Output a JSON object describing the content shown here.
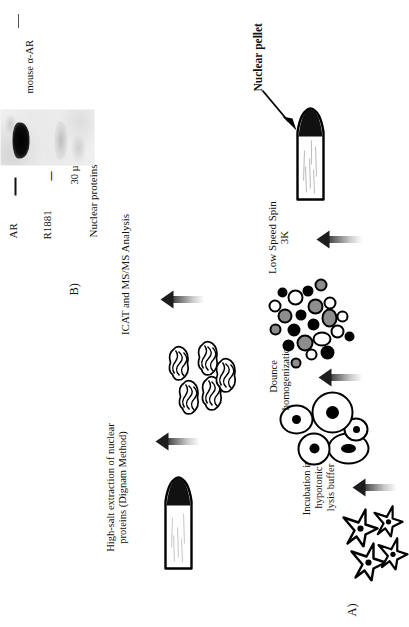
{
  "figure": {
    "panels": [
      {
        "tag": "A)"
      },
      {
        "tag": "B)"
      }
    ]
  },
  "panel_a": {
    "tag": "A)",
    "steps": [
      {
        "name": "cells",
        "caption": ""
      },
      {
        "name": "lysis",
        "caption": "Incubation in hypotonic\nlysis buffer"
      },
      {
        "name": "nuclei",
        "caption": ""
      },
      {
        "name": "homogenize",
        "caption": "Dounce\nhomogenization"
      },
      {
        "name": "homogenate",
        "caption": ""
      },
      {
        "name": "spin",
        "caption": "Low Speed Spin\n3K"
      },
      {
        "name": "pellet-tube",
        "caption": ""
      }
    ],
    "pellet_label": "Nuclear pellet",
    "extraction_caption": "High-salt extraction of nuclear\nproteins (Dignam Method)",
    "analysis_caption": "ICAT and MS/MS Analysis"
  },
  "panel_b": {
    "tag": "B)",
    "sample_label": "Nuclear proteins",
    "loads": [
      "30 µg",
      "30 µg"
    ],
    "treatment_row_label": "R1881",
    "treatments": [
      "–",
      "+"
    ],
    "target_label": "AR",
    "antibody_label": "mouse α-AR",
    "lanes": [
      {
        "treatment": "–",
        "load": "30 µg",
        "band": "strong"
      },
      {
        "treatment": "+",
        "load": "30 µg",
        "band": "faint"
      }
    ]
  },
  "colors": {
    "ink": "#111111",
    "arrow_dark": "#1d1d1d",
    "blot_background": "#efefef",
    "band_strong": "#000000",
    "band_faint": "#9a9a9a"
  }
}
